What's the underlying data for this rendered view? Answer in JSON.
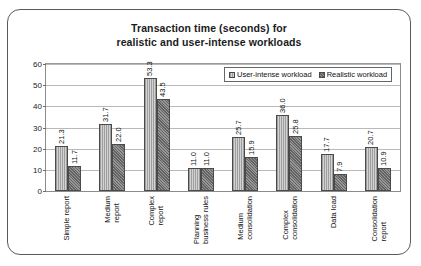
{
  "chart_data": {
    "type": "bar",
    "title": "Transaction time (seconds) for realistic and user-intense workloads",
    "title_line1": "Transaction time (seconds) for",
    "title_line2": "realistic and user-intense workloads",
    "xlabel": "",
    "ylabel": "",
    "ylim": [
      0,
      60
    ],
    "yticks": [
      0,
      10,
      20,
      30,
      40,
      50,
      60
    ],
    "grid": true,
    "legend_position": "top-right",
    "categories": [
      "Simple report",
      "Medium report",
      "Complex report",
      "Planning business rules",
      "Medium consolidation",
      "Complex consolidation",
      "Data load",
      "Consolidation report"
    ],
    "category_lines": [
      [
        "Simple report"
      ],
      [
        "Medium",
        "report"
      ],
      [
        "Complex",
        "report"
      ],
      [
        "Planning",
        "business rules"
      ],
      [
        "Medium",
        "consolidation"
      ],
      [
        "Complex",
        "consolidation"
      ],
      [
        "Data load"
      ],
      [
        "Consolidation",
        "report"
      ]
    ],
    "series": [
      {
        "name": "User-intense workload",
        "values": [
          21.3,
          31.7,
          53.3,
          11.0,
          25.7,
          36.0,
          17.7,
          20.7
        ],
        "labels": [
          "21.3",
          "31.7",
          "53.3",
          "11.0",
          "25.7",
          "36.0",
          "17.7",
          "20.7"
        ],
        "color": "#b4b4b4"
      },
      {
        "name": "Realistic workload",
        "values": [
          11.7,
          22.0,
          43.5,
          11.0,
          15.9,
          25.8,
          7.9,
          10.9
        ],
        "labels": [
          "11.7",
          "22.0",
          "43.5",
          "11.0",
          "15.9",
          "25.8",
          "7.9",
          "10.9"
        ],
        "color": "#7d7d7d"
      }
    ]
  },
  "legend": {
    "items": [
      {
        "label": "User-intense workload"
      },
      {
        "label": "Realistic workload"
      }
    ]
  },
  "axis": {
    "y_tick_labels": [
      "60",
      "50",
      "40",
      "30",
      "20",
      "10",
      "0"
    ]
  }
}
